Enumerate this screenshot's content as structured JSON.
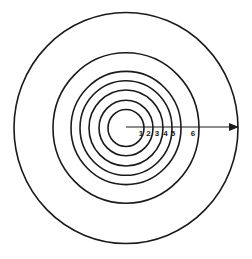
{
  "diagram": {
    "title": "",
    "type": "concentric-circles",
    "center": {
      "x": 126,
      "y": 128
    },
    "stroke_color": "#1a1a1a",
    "background": "#ffffff",
    "rings": [
      {
        "rx": 18,
        "ry": 18.5
      },
      {
        "rx": 27,
        "ry": 27.8
      },
      {
        "rx": 37,
        "ry": 38
      },
      {
        "rx": 46,
        "ry": 47.3
      },
      {
        "rx": 55,
        "ry": 56.6
      },
      {
        "rx": 73,
        "ry": 75.2
      },
      {
        "rx": 112,
        "ry": 115.5
      }
    ],
    "arrow": {
      "x1": 126,
      "y1": 127,
      "x2": 238,
      "y2": 127
    },
    "labels": [
      {
        "text": "1",
        "x": 141,
        "y": 136
      },
      {
        "text": "2",
        "x": 148.5,
        "y": 136
      },
      {
        "text": "3",
        "x": 157,
        "y": 136
      },
      {
        "text": "4",
        "x": 165.5,
        "y": 136
      },
      {
        "text": "5",
        "x": 173,
        "y": 136
      },
      {
        "text": "6",
        "x": 193,
        "y": 136
      }
    ]
  }
}
